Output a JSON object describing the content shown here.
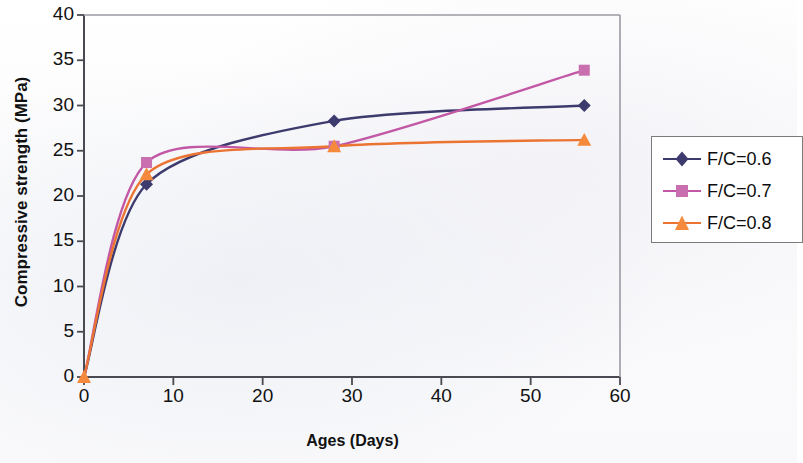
{
  "chart_data": {
    "type": "line",
    "title": "",
    "xlabel": "Ages (Days)",
    "ylabel": "Compressive strength (MPa)",
    "xlim": [
      0,
      60
    ],
    "ylim": [
      0,
      40
    ],
    "xticks": [
      0,
      10,
      20,
      30,
      40,
      50,
      60
    ],
    "yticks": [
      0,
      5,
      10,
      15,
      20,
      25,
      30,
      35,
      40
    ],
    "grid": false,
    "legend_position": "right",
    "x": [
      0,
      7,
      28,
      56
    ],
    "series": [
      {
        "name": "F/C=0.6",
        "marker": "diamond",
        "color": "#3d3a6e",
        "values": [
          0,
          21.3,
          28.3,
          30.0
        ]
      },
      {
        "name": "F/C=0.7",
        "marker": "square",
        "color": "#c258a5",
        "values": [
          0,
          23.7,
          25.5,
          33.9
        ]
      },
      {
        "name": "F/C=0.8",
        "marker": "triangle",
        "color": "#ec7433",
        "values": [
          0,
          22.4,
          25.5,
          26.2
        ]
      }
    ]
  },
  "axes": {
    "xlabel": "Ages (Days)",
    "ylabel": "Compressive strength (MPa)",
    "xtick_labels": [
      "0",
      "10",
      "20",
      "30",
      "40",
      "50",
      "60"
    ],
    "ytick_labels": [
      "0",
      "5",
      "10",
      "15",
      "20",
      "25",
      "30",
      "35",
      "40"
    ]
  },
  "legend": {
    "entries": [
      {
        "label": "F/C=0.6",
        "color": "#3d3a6e",
        "marker": "diamond"
      },
      {
        "label": "F/C=0.7",
        "color": "#c258a5",
        "marker": "square"
      },
      {
        "label": "F/C=0.8",
        "color": "#ec7433",
        "marker": "triangle"
      }
    ]
  },
  "colors": {
    "series_1": "#3d3a6e",
    "series_2": "#c258a5",
    "series_3": "#ec7433",
    "axis": "#4a4a52",
    "text": "#111111",
    "background": "#fcfcfc"
  }
}
